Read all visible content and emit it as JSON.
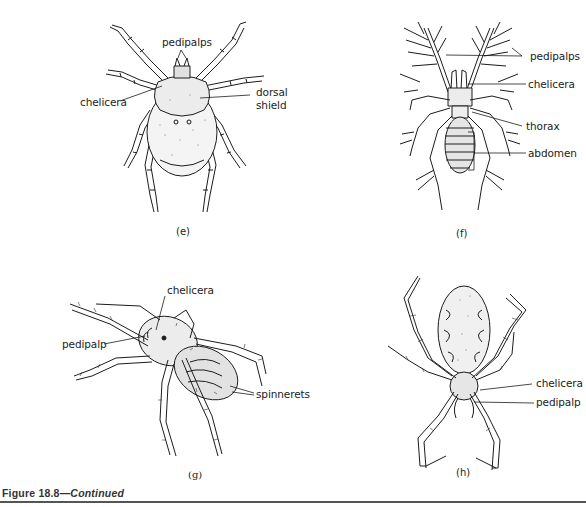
{
  "figure": {
    "number": "Figure 18.8",
    "separator": "—",
    "continued": "Continued",
    "panels": [
      {
        "id": "e",
        "panel_label": "(e)",
        "subject": "tick",
        "labels": [
          "pedipalps",
          "chelicera",
          "dorsal",
          "shield"
        ]
      },
      {
        "id": "f",
        "panel_label": "(f)",
        "subject": "pseudoscorpion-like arachnid",
        "labels": [
          "pedipalps",
          "chelicera",
          "thorax",
          "abdomen"
        ]
      },
      {
        "id": "g",
        "panel_label": "(g)",
        "subject": "hairy spider",
        "labels": [
          "chelicera",
          "pedipalp",
          "spinnerets"
        ]
      },
      {
        "id": "h",
        "panel_label": "(h)",
        "subject": "orb-weaver spider",
        "labels": [
          "chelicera",
          "pedipalp"
        ]
      }
    ]
  },
  "colors": {
    "ink": "#1c1c1c",
    "rule": "#555555",
    "background": "#ffffff"
  }
}
